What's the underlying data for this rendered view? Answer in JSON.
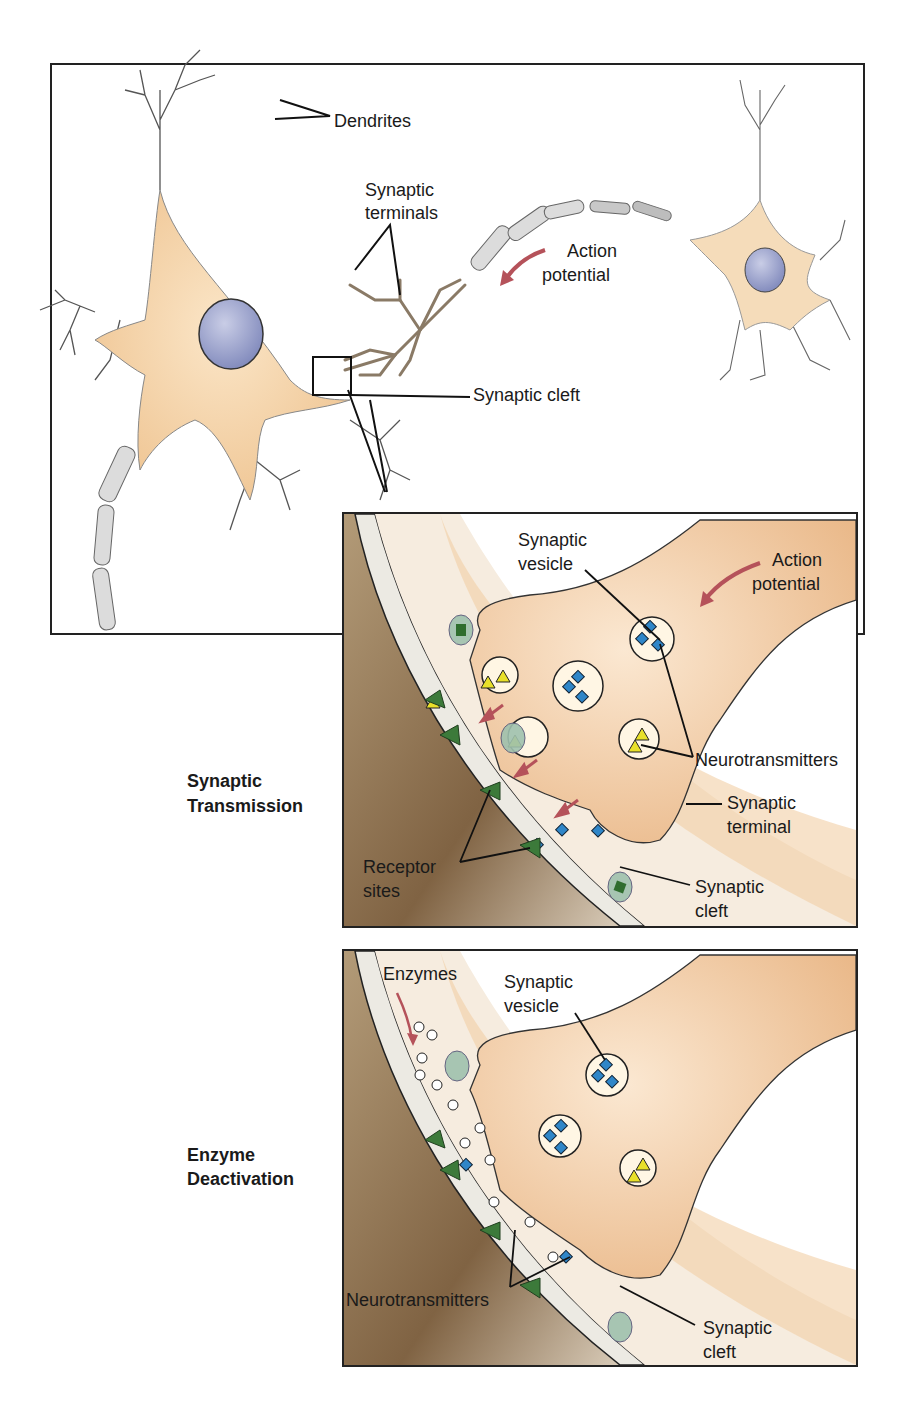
{
  "overview": {
    "labels": {
      "dendrites": "Dendrites",
      "synaptic_terminals_l1": "Synaptic",
      "synaptic_terminals_l2": "terminals",
      "action_potential_l1": "Action",
      "action_potential_l2": "potential",
      "synaptic_cleft": "Synaptic cleft"
    }
  },
  "panels": [
    {
      "title_l1": "Synaptic",
      "title_l2": "Transmission",
      "labels": {
        "synaptic_vesicle_l1": "Synaptic",
        "synaptic_vesicle_l2": "vesicle",
        "action_potential_l1": "Action",
        "action_potential_l2": "potential",
        "neurotransmitters": "Neurotransmitters",
        "synaptic_terminal_l1": "Synaptic",
        "synaptic_terminal_l2": "terminal",
        "receptor_sites_l1": "Receptor",
        "receptor_sites_l2": "sites",
        "synaptic_cleft_l1": "Synaptic",
        "synaptic_cleft_l2": "cleft"
      }
    },
    {
      "title_l1": "Enzyme",
      "title_l2": "Deactivation",
      "labels": {
        "enzymes": "Enzymes",
        "synaptic_vesicle_l1": "Synaptic",
        "synaptic_vesicle_l2": "vesicle",
        "neurotransmitters": "Neurotransmitters",
        "synaptic_cleft_l1": "Synaptic",
        "synaptic_cleft_l2": "cleft"
      }
    }
  ],
  "colors": {
    "cell_body": "#f3d3aa",
    "nucleus": "#9aa3cc",
    "myelin": "#d9d9d9",
    "postsynaptic": "#8a6d4a",
    "receptor": "#3c7a3a",
    "neurotransmitter_blue": "#2f86c8",
    "neurotransmitter_yellow": "#e8e02a",
    "arrow": "#b5525a"
  }
}
